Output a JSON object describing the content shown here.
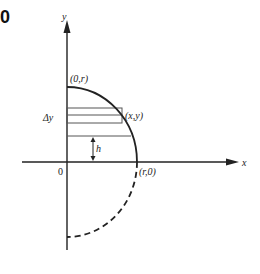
{
  "panel_label": "0",
  "axes": {
    "x_label": "x",
    "y_label": "y",
    "origin_label": "0"
  },
  "points": {
    "top": "(0,r)",
    "right": "(r,0)",
    "on_curve": "(x,y)"
  },
  "annotations": {
    "delta_y": "Δy",
    "height": "h"
  },
  "curve": {
    "upper": "solid quarter circle",
    "lower": "dashed quarter circle"
  },
  "colors": {
    "line": "#222222",
    "rect": "#555555",
    "background": "#ffffff"
  }
}
